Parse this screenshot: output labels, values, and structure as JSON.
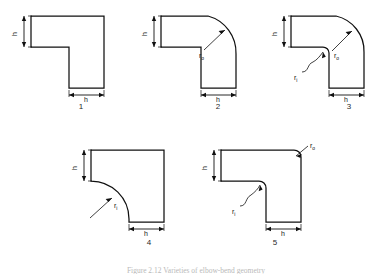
{
  "figure": {
    "caption": "Figure 2.12  Varieties of elbow-bend geometry",
    "background": "#ffffff",
    "line_color": "#101010"
  },
  "labels": {
    "thickness": "h",
    "outer_radius": "r",
    "outer_radius_sub": "o",
    "inner_radius": "r",
    "inner_radius_sub": "i"
  },
  "panels": [
    {
      "number": "1",
      "name": "square-corner-elbow",
      "outer_corner": "sharp",
      "inner_corner": "sharp",
      "dims": [
        "h-vertical",
        "h-horizontal"
      ],
      "radius_labels": []
    },
    {
      "number": "2",
      "name": "outer-radius-elbow",
      "outer_corner": "rounded",
      "inner_corner": "sharp",
      "dims": [
        "h-vertical",
        "h-horizontal"
      ],
      "radius_labels": [
        "r_o"
      ]
    },
    {
      "number": "3",
      "name": "outer-and-inner-radius-elbow",
      "outer_corner": "rounded",
      "inner_corner": "rounded",
      "dims": [
        "h-vertical",
        "h-horizontal"
      ],
      "radius_labels": [
        "r_o",
        "r_i"
      ]
    },
    {
      "number": "4",
      "name": "inner-radius-elbow",
      "outer_corner": "sharp",
      "inner_corner": "rounded",
      "dims": [
        "h-vertical",
        "h-horizontal"
      ],
      "radius_labels": [
        "r_i"
      ]
    },
    {
      "number": "5",
      "name": "filleted-corner-elbow",
      "outer_corner": "small-fillet",
      "inner_corner": "small-fillet",
      "dims": [
        "h-vertical",
        "h-horizontal"
      ],
      "radius_labels": [
        "r_o",
        "r_i"
      ]
    }
  ]
}
